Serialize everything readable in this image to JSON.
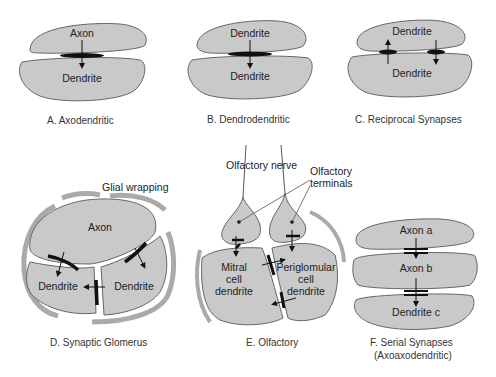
{
  "colors": {
    "cell_fill": "#c9c9c9",
    "outline": "#555555",
    "synapse": "#111111",
    "background": "#ffffff"
  },
  "panels": [
    {
      "id": "A",
      "caption": "A. Axodendritic",
      "top_label": "Axon",
      "bottom_label": "Dendrite"
    },
    {
      "id": "B",
      "caption": "B. Dendrodendritic",
      "top_label": "Dendrite",
      "bottom_label": "Dendrite"
    },
    {
      "id": "C",
      "caption": "C. Reciprocal Synapses",
      "top_label": "Dendrite",
      "bottom_label": "Dendrite"
    },
    {
      "id": "D",
      "caption": "D. Synaptic Glomerus",
      "annotation": "Glial wrapping",
      "top_label": "Axon",
      "left_label": "Dendrite",
      "right_label": "Dendrite"
    },
    {
      "id": "E",
      "caption": "E. Olfactory",
      "annotation_nerve": "Olfactory nerve",
      "annotation_terminals_1": "Olfactory",
      "annotation_terminals_2": "terminals",
      "left_label_1": "Mitral",
      "left_label_2": "cell",
      "left_label_3": "dendrite",
      "right_label_1": "Periglomular",
      "right_label_2": "cell",
      "right_label_3": "dendrite"
    },
    {
      "id": "F",
      "caption_1": "F. Serial Synapses",
      "caption_2": "(Axoaxodendritic)",
      "top_label": "Axon a",
      "middle_label": "Axon b",
      "bottom_label": "Dendrite c"
    }
  ]
}
